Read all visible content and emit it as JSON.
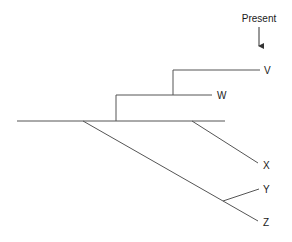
{
  "diagram": {
    "type": "phylogenetic-tree",
    "time_marker": {
      "label": "Present",
      "arrow": "down"
    },
    "taxa": [
      {
        "id": "V",
        "label": "V"
      },
      {
        "id": "W",
        "label": "W"
      },
      {
        "id": "X",
        "label": "X"
      },
      {
        "id": "Y",
        "label": "Y"
      },
      {
        "id": "Z",
        "label": "Z"
      }
    ],
    "colors": {
      "line": "#555555",
      "text": "#1a1a1a",
      "background": "#ffffff"
    }
  }
}
